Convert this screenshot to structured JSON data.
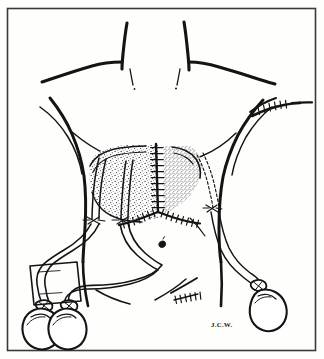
{
  "figure": {
    "signature": "J.C.W.",
    "border_color": "#3a3a3a",
    "background_color": "#fefefd",
    "ink_color": "#141414",
    "stipple_color": "#2b2b2b"
  },
  "anatomy": {
    "regions": [
      {
        "name": "neck",
        "label": "Neck"
      },
      {
        "name": "left-shoulder",
        "label": "Left shoulder"
      },
      {
        "name": "right-shoulder",
        "label": "Right shoulder"
      },
      {
        "name": "chest",
        "label": "Chest"
      },
      {
        "name": "abdomen",
        "label": "Abdomen"
      },
      {
        "name": "umbilicus",
        "label": "Umbilicus"
      },
      {
        "name": "flank-left",
        "label": "Left flank"
      },
      {
        "name": "flank-right",
        "label": "Right flank"
      }
    ]
  },
  "surgical_features": {
    "graft_area": {
      "name": "stippled-graft-region",
      "label": "Stippled graft / flap region",
      "fill_pattern": "stipple"
    },
    "incisions": [
      {
        "name": "midline-vertical-incision",
        "label": "Midline vertical sutured incision",
        "sutures": 11
      },
      {
        "name": "chevron-incision-left",
        "label": "Left oblique sutured limb",
        "sutures": 7
      },
      {
        "name": "chevron-incision-right",
        "label": "Right oblique sutured limb",
        "sutures": 8
      },
      {
        "name": "right-clavicular-incision",
        "label": "Right infraclavicular sutured incision",
        "sutures": 6
      },
      {
        "name": "right-lower-abdominal-incision",
        "label": "Right lower abdominal sutured incision",
        "sutures": 6
      }
    ],
    "drains": [
      {
        "name": "drain-left-lateral",
        "label": "Left lateral drain",
        "bulb": "bulb-left-outer",
        "tunneled": false
      },
      {
        "name": "drain-left-medial",
        "label": "Left medial drain",
        "bulb": "bulb-left-inner",
        "tunneled": false
      },
      {
        "name": "drain-right",
        "label": "Right tunneled drain",
        "bulb": "bulb-right",
        "tunneled": true
      }
    ],
    "bulbs": [
      {
        "name": "bulb-left-outer",
        "label": "Closed-suction bulb reservoir (left outer)"
      },
      {
        "name": "bulb-left-inner",
        "label": "Closed-suction bulb reservoir (left inner)"
      },
      {
        "name": "bulb-right",
        "label": "Closed-suction bulb reservoir (right)"
      }
    ],
    "dressing": {
      "name": "gauze-dressing-pad",
      "label": "Rectangular gauze dressing pad"
    },
    "exit_site_sutures": [
      {
        "name": "exit-suture-left-lateral",
        "label": "Drain exit-site anchoring suture (left lateral)"
      },
      {
        "name": "exit-suture-left-medial",
        "label": "Drain exit-site anchoring suture (left medial)"
      },
      {
        "name": "exit-suture-right",
        "label": "Drain exit-site anchoring suture (right)"
      }
    ]
  }
}
